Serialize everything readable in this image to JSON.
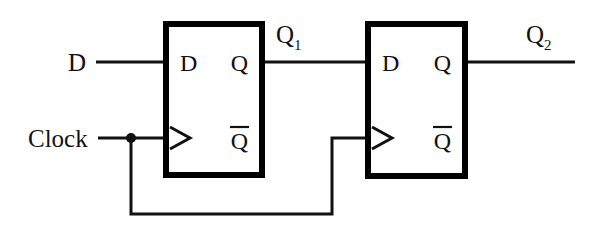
{
  "diagram": {
    "background_color": "#ffffff",
    "line_color": "#111111",
    "box_fill": "#ffffff",
    "box_stroke": "#000000",
    "inputs": {
      "data_label": "D",
      "clock_label": "Clock"
    },
    "nets": {
      "q1_label": "Q",
      "q1_subscript": "1",
      "q2_label": "Q",
      "q2_subscript": "2"
    },
    "flipflops": [
      {
        "name": "flip-flop-1",
        "d_pin": "D",
        "q_pin": "Q",
        "qbar_pin": "Q",
        "qbar_has_overbar": true,
        "clock_pin_symbol": "triangle"
      },
      {
        "name": "flip-flop-2",
        "d_pin": "D",
        "q_pin": "Q",
        "qbar_pin": "Q",
        "qbar_has_overbar": true,
        "clock_pin_symbol": "triangle"
      }
    ]
  }
}
